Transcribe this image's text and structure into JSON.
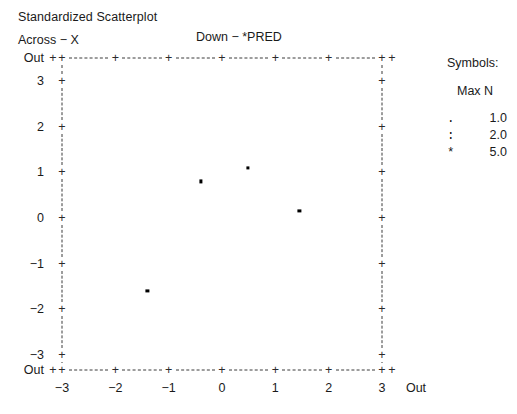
{
  "header": {
    "title": "Standardized Scatterplot",
    "across_label": "Across − X",
    "down_label": "Down − *PRED"
  },
  "legend": {
    "title": "Symbols:",
    "subtitle": "Max N",
    "rows": [
      {
        "symbol": ".",
        "value": "1.0"
      },
      {
        "symbol": ":",
        "value": "2.0"
      },
      {
        "symbol": "*",
        "value": "5.0"
      }
    ]
  },
  "axes": {
    "y_out_top": "Out",
    "y_out_bottom": "Out",
    "x_out_right": "Out",
    "tick_glyph": "+",
    "y_ticks": [
      "3",
      "2",
      "1",
      "0",
      "−1",
      "−2",
      "−3"
    ],
    "x_ticks": [
      "−3",
      "−2",
      "−1",
      "0",
      "1",
      "2",
      "3"
    ]
  },
  "chart_data": {
    "type": "scatter",
    "title": "Standardized Scatterplot",
    "xlabel": "Across − X",
    "ylabel": "Down − *PRED",
    "xlim": [
      -3,
      3
    ],
    "ylim": [
      -3,
      3
    ],
    "grid": false,
    "legend_position": "right",
    "x": [
      -0.4,
      0.48,
      1.45,
      -1.4
    ],
    "y": [
      0.8,
      1.1,
      0.15,
      -1.6
    ],
    "points": [
      {
        "x": -0.4,
        "y": 0.8
      },
      {
        "x": 0.48,
        "y": 1.1
      },
      {
        "x": 1.45,
        "y": 0.15
      },
      {
        "x": -1.4,
        "y": -1.6
      }
    ],
    "series": [
      {
        "name": "observations",
        "values": [
          {
            "x": -0.4,
            "y": 0.8
          },
          {
            "x": 0.48,
            "y": 1.1
          },
          {
            "x": 1.45,
            "y": 0.15
          },
          {
            "x": -1.4,
            "y": -1.6
          }
        ]
      }
    ]
  },
  "geometry": {
    "x_out_left_px": 53,
    "x_min_px": 62,
    "x_max_px": 382,
    "x_out_right_px": 392,
    "y_out_top_px": 58,
    "y_max_px": 81,
    "y_min_px": 355,
    "y_out_bottom_px": 370,
    "px_per_x_unit": 53.33,
    "px_per_y_unit": 45.67
  }
}
